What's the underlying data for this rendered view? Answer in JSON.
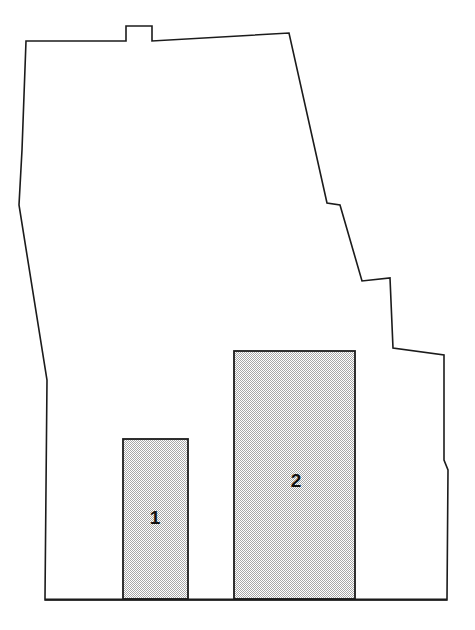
{
  "figure": {
    "kind": "site-plan-diagram",
    "width": 475,
    "height": 630,
    "background_color": "#ffffff",
    "title": "",
    "caption": ""
  },
  "colors": {
    "outline_stroke": "#1b1b1b",
    "parcel_fill": "#ffffff",
    "block_stroke": "#1b1b1b",
    "block_fill_base": "#ffffff",
    "block_fill_dots": "#9a9a9a",
    "label_color": "#111111"
  },
  "parcel": {
    "name": "property-boundary",
    "stroke_width": 1.6,
    "points": "26,41 126,41 126,26 152,26 152,41 289,33 327,203 340,205 362,281 390,278 393,348 444,355 444,460 448,470 447,600 45,600 45,598 47,380 19,205 22,150 26,41"
  },
  "blocks": [
    {
      "id": "block-1",
      "label": "1",
      "x": 123,
      "y": 439,
      "width": 65,
      "height": 160,
      "label_x": 155,
      "label_y": 519,
      "fill": "dotted-screen"
    },
    {
      "id": "block-2",
      "label": "2",
      "x": 234,
      "y": 351,
      "width": 121,
      "height": 248,
      "label_x": 296,
      "label_y": 482,
      "fill": "dotted-screen"
    }
  ],
  "baseline": {
    "name": "front-lot-line",
    "x1": 45,
    "y1": 599.5,
    "x2": 447,
    "y2": 599.5
  }
}
